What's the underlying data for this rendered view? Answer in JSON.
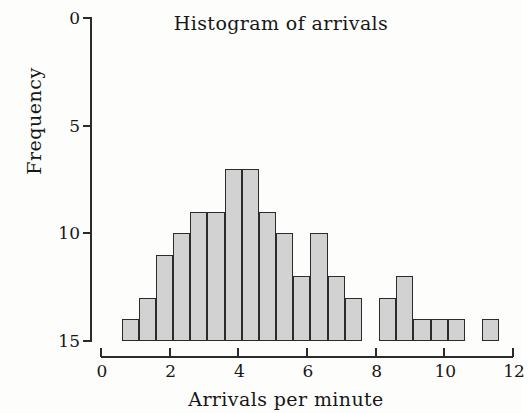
{
  "chart_data": {
    "type": "bar",
    "title": "Histogram of arrivals",
    "xlabel": "Arrivals per minute",
    "ylabel": "Frequency",
    "subtitle": "",
    "grid": false,
    "legend": false,
    "legend_position": "none",
    "axis_inverted_y": true,
    "xlim": [
      0,
      12
    ],
    "ylim": [
      15,
      0
    ],
    "xticks": [
      0,
      2,
      4,
      6,
      8,
      10,
      12
    ],
    "xtick_labels": [
      "0",
      "2",
      "4",
      "6",
      "8",
      "10",
      "12"
    ],
    "yticks": [
      0,
      5,
      10,
      15
    ],
    "ytick_labels": [
      "0",
      "5",
      "10",
      "15"
    ],
    "bin_width": 0.5,
    "bin_starts": [
      0.6,
      1.1,
      1.6,
      2.1,
      2.6,
      3.1,
      3.6,
      4.1,
      4.6,
      5.1,
      5.6,
      6.1,
      6.6,
      7.1,
      7.6,
      8.1,
      8.6,
      9.1,
      9.6,
      10.1,
      10.6,
      11.1
    ],
    "bar_top_values": [
      14,
      13,
      11,
      10,
      9,
      9,
      7,
      7,
      9,
      10,
      12,
      10,
      12,
      13,
      15,
      13,
      12,
      14,
      14,
      14,
      15,
      14
    ],
    "values": [
      1,
      2,
      4,
      5,
      6,
      6,
      8,
      8,
      6,
      5,
      3,
      5,
      3,
      2,
      0,
      2,
      3,
      1,
      1,
      1,
      0,
      1
    ],
    "bar_fill_color": "#d2d2d2",
    "bar_edge_color": "#2b2b2b",
    "axis_color": "#2b2b2b",
    "background_color": "#fdfdfc"
  },
  "figure": {
    "title": "Histogram of arrivals",
    "xlabel": "Arrivals per minute",
    "ylabel": "Frequency"
  }
}
